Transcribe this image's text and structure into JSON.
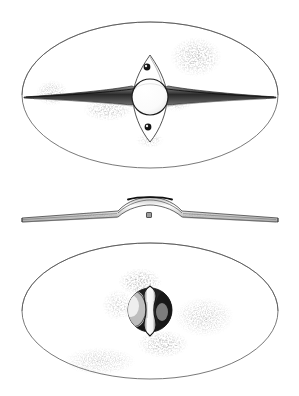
{
  "figure": {
    "kind": "archaeological-object-illustration",
    "technique": "ink line drawing with stipple shading",
    "background_color": "#ffffff",
    "ink_color": "#1a1a1a",
    "outline_color": "#5a5a5a",
    "shadow_color": "#9a9a9a",
    "views": [
      {
        "id": "front-view",
        "label": "front view",
        "position": "top",
        "outline_shape": "ellipse",
        "outline_center": [
          150,
          95
        ],
        "outline_radii": [
          128,
          73
        ],
        "features": [
          {
            "id": "spine-bar",
            "label": "horizontal spine",
            "description": "long tapering rib crossing the full width, pointed at both ends",
            "span_x": [
              24,
              276
            ],
            "center_y": 97
          },
          {
            "id": "boss-dome",
            "label": "central domed boss",
            "description": "circular raised dome at the centre",
            "center": [
              150,
              97
            ],
            "radius": 18
          },
          {
            "id": "vertical-plate",
            "label": "vertical lenticular plate",
            "description": "pointed oval plate set vertically behind the boss",
            "span_y": [
              55,
              142
            ],
            "half_width": 17
          },
          {
            "id": "rivet-upper",
            "label": "upper rivet",
            "center": [
              147,
              67
            ],
            "radius": 3.4
          },
          {
            "id": "rivet-lower",
            "label": "lower rivet",
            "center": [
              148,
              127
            ],
            "radius": 3.4
          }
        ],
        "stipple_patches": [
          {
            "id": "stipple-upper-right",
            "center": [
              196,
              57
            ],
            "radii": [
              26,
              20
            ]
          },
          {
            "id": "stipple-left-spine",
            "center": [
              52,
              93
            ],
            "radii": [
              16,
              13
            ]
          },
          {
            "id": "stipple-lower-left-spine",
            "center": [
              108,
              110
            ],
            "radii": [
              25,
              11
            ]
          },
          {
            "id": "stipple-right-boss",
            "center": [
              176,
              100
            ],
            "radii": [
              18,
              12
            ]
          }
        ]
      },
      {
        "id": "profile-view",
        "label": "profile / side view",
        "position": "middle",
        "description": "thin flat board seen edge-on with a raised central arch over the boss",
        "span_x": [
          22,
          278
        ],
        "base_y": 219,
        "arch": {
          "id": "boss-arch",
          "label": "raised boss arch",
          "span_x": [
            110,
            190
          ],
          "apex_y": 201
        },
        "grip_detail": {
          "id": "grip-square",
          "label": "grip rivet seen end-on",
          "center": [
            149,
            215
          ],
          "size": 5
        }
      },
      {
        "id": "rear-view",
        "label": "rear / underside view",
        "position": "bottom",
        "outline_shape": "ellipse",
        "outline_center": [
          150,
          311
        ],
        "outline_radii": [
          128,
          68
        ],
        "features": [
          {
            "id": "boss-cavity",
            "label": "hollow interior of the boss",
            "description": "dark circular cavity under the dome",
            "center": [
              150,
              310
            ],
            "radius": 22
          },
          {
            "id": "handgrip",
            "label": "vertical handgrip bar",
            "description": "waisted strap crossing the cavity vertically",
            "span_y": [
              286,
              336
            ],
            "waist_width": 5,
            "flare_width": 11
          }
        ],
        "stipple_patches": [
          {
            "id": "stipple-above-cavity",
            "center": [
              140,
              282
            ],
            "radii": [
              22,
              14
            ]
          },
          {
            "id": "stipple-right-cavity",
            "center": [
              204,
              317
            ],
            "radii": [
              30,
              20
            ]
          },
          {
            "id": "stipple-below-cavity",
            "center": [
              163,
              344
            ],
            "radii": [
              26,
              14
            ]
          },
          {
            "id": "stipple-lower-left",
            "center": [
              100,
              361
            ],
            "radii": [
              36,
              14
            ]
          }
        ]
      }
    ]
  }
}
